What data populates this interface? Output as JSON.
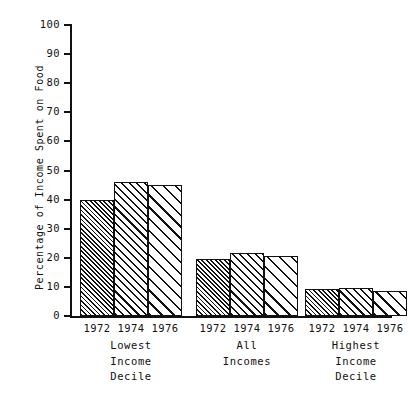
{
  "chart_data": {
    "type": "bar",
    "title": "",
    "subtitle": "",
    "xlabel": "",
    "ylabel": "Percentage of Income Spent on Food",
    "ylim": [
      0,
      100
    ],
    "yticks": [
      0,
      10,
      20,
      30,
      40,
      50,
      60,
      70,
      80,
      90,
      100
    ],
    "ytick_labels": [
      "0",
      "10",
      "20",
      "30",
      "40",
      "50",
      "60",
      "70",
      "80",
      "90",
      "100"
    ],
    "grid": false,
    "legend": "none",
    "categories": [
      "Lowest Income Decile",
      "All Incomes",
      "Highest Income Decile"
    ],
    "category_lines": [
      [
        "Lowest",
        "Income",
        "Decile"
      ],
      [
        "All",
        "Incomes"
      ],
      [
        "Highest",
        "Income",
        "Decile"
      ]
    ],
    "series": [
      {
        "name": "1972",
        "values": [
          39.7,
          19.7,
          9.2
        ],
        "hatch": "dense"
      },
      {
        "name": "1974",
        "values": [
          46.0,
          21.6,
          9.7
        ],
        "hatch": "medium"
      },
      {
        "name": "1976",
        "values": [
          45.0,
          20.5,
          8.7
        ],
        "hatch": "wide"
      }
    ],
    "year_labels": [
      "1972",
      "1974",
      "1976"
    ],
    "colors": {
      "ink": "#111111",
      "background": "#ffffff"
    }
  }
}
